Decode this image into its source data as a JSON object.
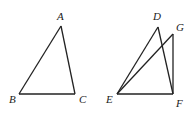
{
  "figures": [
    {
      "name": "triangle-ABC",
      "vertices": {
        "A": {
          "label": "A",
          "x": 61,
          "y": 26,
          "lx": 57,
          "ly": 20
        },
        "B": {
          "label": "B",
          "x": 19,
          "y": 94,
          "lx": 9,
          "ly": 103
        },
        "C": {
          "label": "C",
          "x": 75,
          "y": 94,
          "lx": 79,
          "ly": 103
        }
      },
      "edges": [
        [
          "A",
          "B"
        ],
        [
          "B",
          "C"
        ],
        [
          "C",
          "A"
        ]
      ]
    },
    {
      "name": "figure-DEFG",
      "vertices": {
        "D": {
          "label": "D",
          "x": 158,
          "y": 27,
          "lx": 153,
          "ly": 20
        },
        "G": {
          "label": "G",
          "x": 173,
          "y": 34,
          "lx": 176,
          "ly": 31
        },
        "E": {
          "label": "E",
          "x": 117,
          "y": 94,
          "lx": 106,
          "ly": 103
        },
        "F": {
          "label": "F",
          "x": 173,
          "y": 94,
          "lx": 176,
          "ly": 107
        }
      },
      "edges": [
        [
          "D",
          "E"
        ],
        [
          "D",
          "F"
        ],
        [
          "E",
          "F"
        ],
        [
          "E",
          "G"
        ],
        [
          "G",
          "F"
        ]
      ]
    }
  ]
}
